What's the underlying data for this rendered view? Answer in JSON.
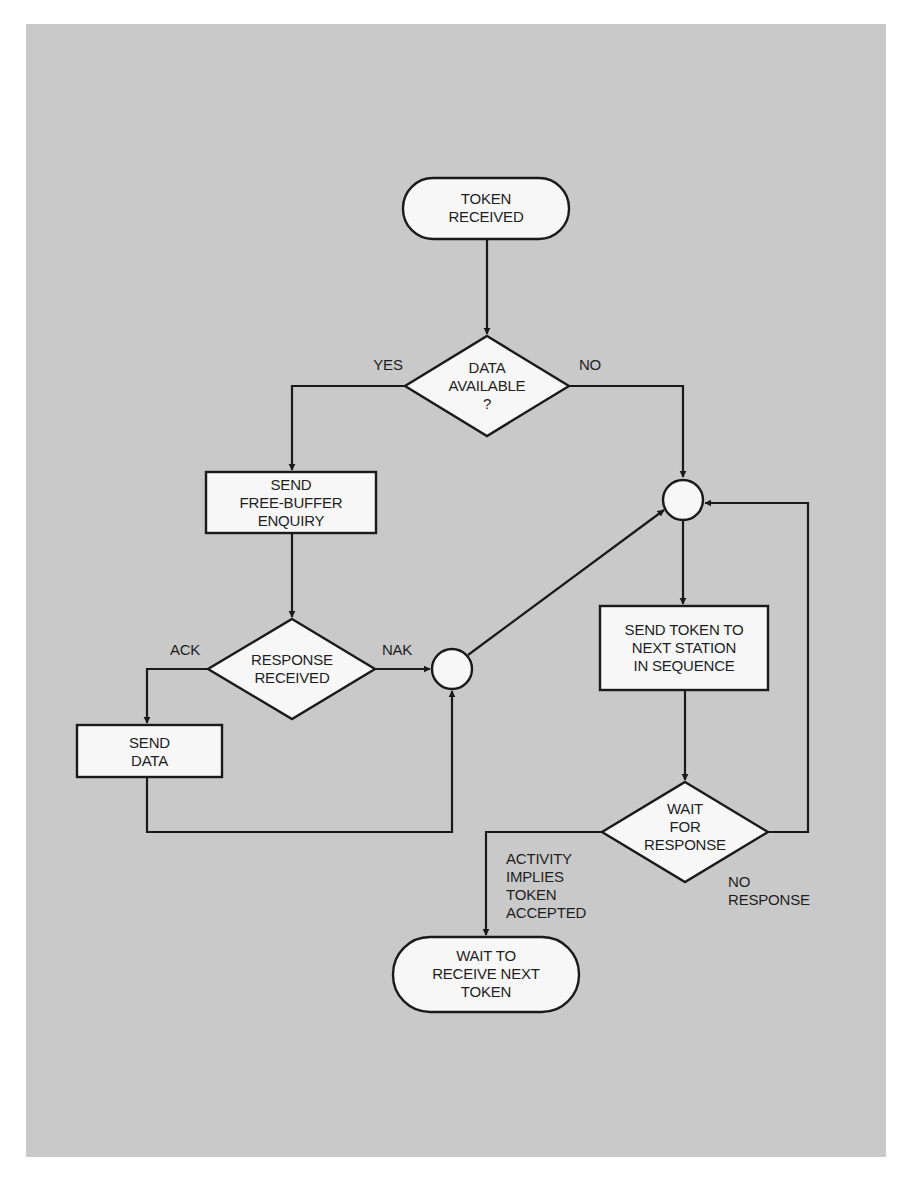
{
  "diagram": {
    "type": "flowchart",
    "title": "",
    "nodes": [
      {
        "id": "token_received",
        "shape": "terminal",
        "text": "TOKEN\nRECEIVED"
      },
      {
        "id": "data_available",
        "shape": "decision",
        "text": "DATA\nAVAILABLE\n?"
      },
      {
        "id": "send_enquiry",
        "shape": "process",
        "text": "SEND\nFREE-BUFFER\nENQUIRY"
      },
      {
        "id": "response_received",
        "shape": "decision",
        "text": "RESPONSE\nRECEIVED"
      },
      {
        "id": "send_data",
        "shape": "process",
        "text": "SEND\nDATA"
      },
      {
        "id": "junction_lower",
        "shape": "connector",
        "text": ""
      },
      {
        "id": "junction_upper",
        "shape": "connector",
        "text": ""
      },
      {
        "id": "send_token",
        "shape": "process",
        "text": "SEND TOKEN TO\nNEXT STATION\nIN SEQUENCE"
      },
      {
        "id": "wait_response",
        "shape": "decision",
        "text": "WAIT\nFOR\nRESPONSE"
      },
      {
        "id": "wait_next_token",
        "shape": "terminal",
        "text": "WAIT TO\nRECEIVE NEXT\nTOKEN"
      }
    ],
    "edges": [
      {
        "from": "token_received",
        "to": "data_available",
        "label": ""
      },
      {
        "from": "data_available",
        "to": "send_enquiry",
        "label": "YES"
      },
      {
        "from": "data_available",
        "to": "junction_upper",
        "label": "NO"
      },
      {
        "from": "send_enquiry",
        "to": "response_received",
        "label": ""
      },
      {
        "from": "response_received",
        "to": "send_data",
        "label": "ACK"
      },
      {
        "from": "response_received",
        "to": "junction_lower",
        "label": "NAK"
      },
      {
        "from": "send_data",
        "to": "junction_lower",
        "label": ""
      },
      {
        "from": "junction_lower",
        "to": "junction_upper",
        "label": ""
      },
      {
        "from": "junction_upper",
        "to": "send_token",
        "label": ""
      },
      {
        "from": "send_token",
        "to": "wait_response",
        "label": ""
      },
      {
        "from": "wait_response",
        "to": "wait_next_token",
        "label": "ACTIVITY\nIMPLIES\nTOKEN\nACCEPTED"
      },
      {
        "from": "wait_response",
        "to": "junction_upper",
        "label": "NO\nRESPONSE"
      }
    ]
  },
  "labels": {
    "token_received": "TOKEN\nRECEIVED",
    "data_available": "DATA\nAVAILABLE\n?",
    "yes": "YES",
    "no": "NO",
    "send_enquiry": "SEND\nFREE-BUFFER\nENQUIRY",
    "response_received": "RESPONSE\nRECEIVED",
    "ack": "ACK",
    "nak": "NAK",
    "send_data": "SEND\nDATA",
    "send_token": "SEND TOKEN TO\nNEXT STATION\nIN SEQUENCE",
    "wait_response": "WAIT\nFOR\nRESPONSE",
    "no_response": "NO\nRESPONSE",
    "activity": "ACTIVITY\nIMPLIES\nTOKEN\nACCEPTED",
    "wait_next_token": "WAIT TO\nRECEIVE NEXT\nTOKEN"
  },
  "colors": {
    "panel_background": "#c9c9c9",
    "page_background": "#ffffff",
    "shape_fill": "#f7f7f7",
    "stroke": "#1a1a1a"
  }
}
